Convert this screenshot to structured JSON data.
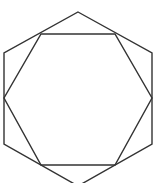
{
  "diagram": {
    "stroke_color": "#333333",
    "background": "#ffffff",
    "outer_hexagon": {
      "points": "78,12 152,53 152,144 78,186 4,144 4,53"
    },
    "inner_hexagon": {
      "points": "41,34 115,34 152,98 115,165 41,165 4,98"
    }
  }
}
